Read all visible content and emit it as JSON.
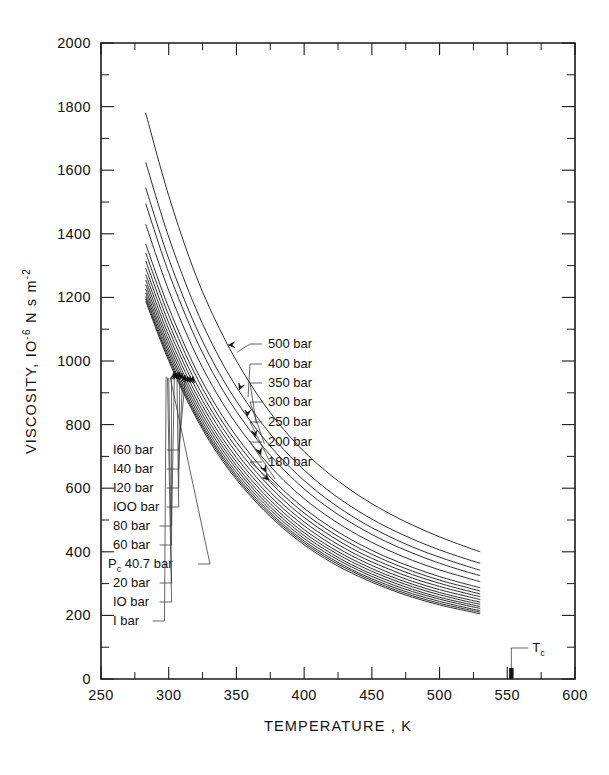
{
  "figure": {
    "background": "#ffffff",
    "ink_color": "#1a1a1a",
    "curve_color": "#222222"
  },
  "axes": {
    "x_title": "TEMPERATURE , K",
    "y_title_main": "VISCOSITY,  IO",
    "y_title_exp": "-6",
    "y_title_unit": "N s m",
    "y_title_unit_exp": "-2",
    "x_ticks": [
      "250",
      "300",
      "350",
      "400",
      "450",
      "500",
      "550",
      "600"
    ],
    "y_ticks": [
      "0",
      "200",
      "400",
      "600",
      "800",
      "1000",
      "1200",
      "1400",
      "1600",
      "1800",
      "2000"
    ],
    "x_min": 250,
    "x_max": 600,
    "y_min": 0,
    "y_max": 2000,
    "x_minor_step": 25,
    "y_minor_step": 100,
    "grid": false
  },
  "markers": {
    "tc_label": "T",
    "tc_sub": "c",
    "tc_value": 553
  },
  "labels_right": [
    {
      "text": "500 bar",
      "y": 348
    },
    {
      "text": "400 bar",
      "y": 368
    },
    {
      "text": "350 bar",
      "y": 387
    },
    {
      "text": "300 bar",
      "y": 406
    },
    {
      "text": "250 bar",
      "y": 426
    },
    {
      "text": "200 bar",
      "y": 446
    },
    {
      "text": "180 bar",
      "y": 466
    }
  ],
  "labels_left": [
    {
      "text": "I60 bar",
      "y": 454
    },
    {
      "text": "I40 bar",
      "y": 473
    },
    {
      "text": "I20 bar",
      "y": 492
    },
    {
      "text": "IOO bar",
      "y": 511
    },
    {
      "text": "80 bar",
      "y": 530
    },
    {
      "text": "60 bar",
      "y": 549
    },
    {
      "text": "40.7 bar",
      "y": 568,
      "prefix": "P",
      "prefix_sub": "c"
    },
    {
      "text": "20 bar",
      "y": 587
    },
    {
      "text": "IO bar",
      "y": 606
    },
    {
      "text": "I bar",
      "y": 625
    }
  ],
  "chart_data": {
    "type": "line",
    "title": "",
    "xlabel": "TEMPERATURE , K",
    "ylabel": "VISCOSITY, 10^-6 N s m^-2",
    "xlim": [
      250,
      600
    ],
    "ylim": [
      0,
      2000
    ],
    "x_unit": "K",
    "y_unit": "10^-6 N s m^-2",
    "grid": false,
    "legend": "inline-leader-labels",
    "series": [
      {
        "name": "500 bar",
        "x": [
          283,
          300,
          320,
          340,
          360,
          380,
          400,
          420,
          440,
          460,
          480,
          500,
          520,
          530
        ],
        "y": [
          1780,
          1520,
          1270,
          1080,
          930,
          810,
          715,
          640,
          578,
          527,
          484,
          447,
          415,
          400
        ]
      },
      {
        "name": "400 bar",
        "x": [
          283,
          300,
          320,
          340,
          360,
          380,
          400,
          420,
          440,
          460,
          480,
          500,
          520,
          530
        ],
        "y": [
          1625,
          1390,
          1165,
          990,
          855,
          745,
          657,
          586,
          528,
          480,
          440,
          406,
          377,
          364
        ]
      },
      {
        "name": "350 bar",
        "x": [
          283,
          300,
          320,
          340,
          360,
          380,
          400,
          420,
          440,
          460,
          480,
          500,
          520,
          530
        ],
        "y": [
          1545,
          1322,
          1108,
          942,
          813,
          708,
          624,
          556,
          500,
          454,
          415,
          383,
          355,
          342
        ]
      },
      {
        "name": "300 bar",
        "x": [
          283,
          300,
          320,
          340,
          360,
          380,
          400,
          420,
          440,
          460,
          480,
          500,
          520,
          530
        ],
        "y": [
          1495,
          1278,
          1070,
          908,
          782,
          680,
          598,
          532,
          478,
          433,
          396,
          364,
          337,
          325
        ]
      },
      {
        "name": "250 bar",
        "x": [
          283,
          300,
          320,
          340,
          360,
          380,
          400,
          420,
          440,
          460,
          480,
          500,
          520,
          530
        ],
        "y": [
          1430,
          1222,
          1022,
          866,
          745,
          646,
          567,
          504,
          452,
          409,
          373,
          343,
          318,
          306
        ]
      },
      {
        "name": "200 bar",
        "x": [
          283,
          300,
          320,
          340,
          360,
          380,
          400,
          420,
          440,
          460,
          480,
          500,
          520,
          530
        ],
        "y": [
          1368,
          1168,
          975,
          825,
          708,
          613,
          537,
          476,
          426,
          385,
          351,
          322,
          298,
          287
        ]
      },
      {
        "name": "180 bar",
        "x": [
          283,
          300,
          320,
          340,
          360,
          380,
          400,
          420,
          440,
          460,
          480,
          500,
          520,
          530
        ],
        "y": [
          1340,
          1144,
          954,
          806,
          691,
          597,
          522,
          462,
          413,
          373,
          339,
          311,
          288,
          277
        ]
      },
      {
        "name": "160 bar",
        "x": [
          283,
          300,
          320,
          340,
          360,
          380,
          400,
          420,
          440,
          460,
          480,
          500,
          520,
          530
        ],
        "y": [
          1315,
          1120,
          933,
          788,
          674,
          582,
          508,
          449,
          400,
          361,
          328,
          301,
          278,
          268
        ]
      },
      {
        "name": "140 bar",
        "x": [
          283,
          300,
          320,
          340,
          360,
          380,
          400,
          420,
          440,
          460,
          480,
          500,
          520,
          530
        ],
        "y": [
          1292,
          1100,
          915,
          771,
          658,
          567,
          494,
          436,
          388,
          350,
          317,
          291,
          269,
          259
        ]
      },
      {
        "name": "120 bar",
        "x": [
          283,
          300,
          320,
          340,
          360,
          380,
          400,
          420,
          440,
          460,
          480,
          500,
          520,
          530
        ],
        "y": [
          1272,
          1081,
          898,
          755,
          644,
          554,
          482,
          424,
          377,
          339,
          307,
          281,
          260,
          250
        ]
      },
      {
        "name": "100 bar",
        "x": [
          283,
          300,
          320,
          340,
          360,
          380,
          400,
          420,
          440,
          460,
          480,
          500,
          520,
          530
        ],
        "y": [
          1255,
          1065,
          883,
          741,
          631,
          542,
          470,
          413,
          367,
          329,
          298,
          272,
          251,
          242
        ]
      },
      {
        "name": "80 bar",
        "x": [
          283,
          300,
          320,
          340,
          360,
          380,
          400,
          420,
          440,
          460,
          480,
          500,
          520,
          530
        ],
        "y": [
          1240,
          1051,
          870,
          729,
          619,
          531,
          460,
          404,
          358,
          321,
          290,
          265,
          244,
          235
        ]
      },
      {
        "name": "60 bar",
        "x": [
          283,
          300,
          320,
          340,
          360,
          380,
          400,
          420,
          440,
          460,
          480,
          500,
          520,
          530
        ],
        "y": [
          1226,
          1038,
          858,
          718,
          609,
          521,
          451,
          395,
          349,
          313,
          282,
          257,
          237,
          228
        ]
      },
      {
        "name": "Pc 40.7 bar",
        "x": [
          283,
          300,
          320,
          340,
          360,
          380,
          400,
          420,
          440,
          460,
          480,
          500,
          520,
          530
        ],
        "y": [
          1214,
          1027,
          847,
          707,
          599,
          512,
          442,
          387,
          342,
          305,
          275,
          251,
          231,
          222
        ]
      },
      {
        "name": "20 bar",
        "x": [
          283,
          300,
          320,
          340,
          360,
          380,
          400,
          420,
          440,
          460,
          480,
          500,
          520,
          530
        ],
        "y": [
          1203,
          1016,
          837,
          698,
          590,
          503,
          434,
          379,
          334,
          298,
          268,
          244,
          224,
          215
        ]
      },
      {
        "name": "10 bar",
        "x": [
          283,
          300,
          320,
          340,
          360,
          380,
          400,
          420,
          440,
          460,
          480,
          500,
          520,
          530
        ],
        "y": [
          1195,
          1008,
          830,
          691,
          583,
          497,
          428,
          373,
          329,
          292,
          262,
          238,
          219,
          210
        ]
      },
      {
        "name": "1 bar",
        "x": [
          283,
          300,
          320,
          340,
          360,
          380,
          400,
          420,
          440,
          460,
          480,
          500,
          520,
          530
        ],
        "y": [
          1188,
          1001,
          823,
          684,
          577,
          491,
          422,
          367,
          323,
          287,
          257,
          233,
          214,
          205
        ]
      }
    ]
  }
}
